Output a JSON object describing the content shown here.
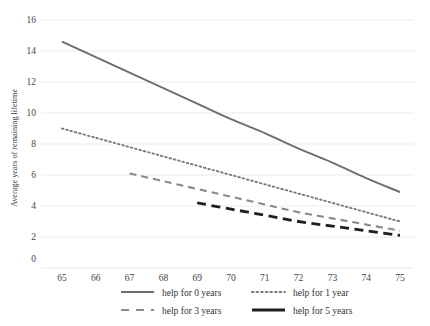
{
  "chart_data": {
    "type": "line",
    "title": "",
    "xlabel": "",
    "ylabel": "Average years of remaining lifetime",
    "xlim": [
      65,
      75
    ],
    "ylim": [
      0,
      16
    ],
    "grid": true,
    "legend_position": "bottom",
    "x_ticks": [
      "65",
      "66",
      "67",
      "68",
      "69",
      "70",
      "71",
      "72",
      "73",
      "74",
      "75"
    ],
    "y_ticks": [
      "0",
      "2",
      "4",
      "6",
      "8",
      "10",
      "12",
      "14",
      "16"
    ],
    "origin_label": "0",
    "series": [
      {
        "name": "help for 0 years",
        "style": "solid",
        "color": "#6e6e6e",
        "width": 1.9,
        "x": [
          65,
          66,
          67,
          68,
          69,
          70,
          71,
          72,
          73,
          74,
          75
        ],
        "values": [
          14.6,
          13.6,
          12.6,
          11.6,
          10.6,
          9.6,
          8.7,
          7.7,
          6.8,
          5.8,
          4.9
        ]
      },
      {
        "name": "help for 1 year",
        "style": "dotted",
        "color": "#7a7a7a",
        "width": 1.9,
        "x": [
          65,
          66,
          67,
          68,
          69,
          70,
          71,
          72,
          73,
          74,
          75
        ],
        "values": [
          9.0,
          8.4,
          7.8,
          7.2,
          6.6,
          6.0,
          5.4,
          4.8,
          4.2,
          3.6,
          3.0
        ]
      },
      {
        "name": "help for 3 years",
        "style": "dashed",
        "color": "#8a8a8a",
        "width": 2.1,
        "x": [
          67,
          68,
          69,
          70,
          71,
          72,
          73,
          74,
          75
        ],
        "values": [
          6.1,
          5.6,
          5.1,
          4.6,
          4.1,
          3.6,
          3.2,
          2.8,
          2.4
        ]
      },
      {
        "name": "help for 5 years",
        "style": "thick-dashed",
        "color": "#1f1f1f",
        "width": 2.8,
        "x": [
          69,
          70,
          71,
          72,
          73,
          74,
          75
        ],
        "values": [
          4.2,
          3.8,
          3.4,
          3.0,
          2.7,
          2.4,
          2.1
        ]
      }
    ]
  },
  "legend": {
    "items": [
      {
        "label": "help for 0 years",
        "style": "solid",
        "color": "#6e6e6e"
      },
      {
        "label": "help for 1 year",
        "style": "dotted",
        "color": "#7a7a7a"
      },
      {
        "label": "help for 3 years",
        "style": "dashed",
        "color": "#8a8a8a"
      },
      {
        "label": "help for 5 years",
        "style": "thick-dashed",
        "color": "#1f1f1f"
      }
    ]
  },
  "colors": {
    "gridline": "#e9e9e9",
    "background": "#ffffff",
    "text": "#3a3a3a"
  }
}
